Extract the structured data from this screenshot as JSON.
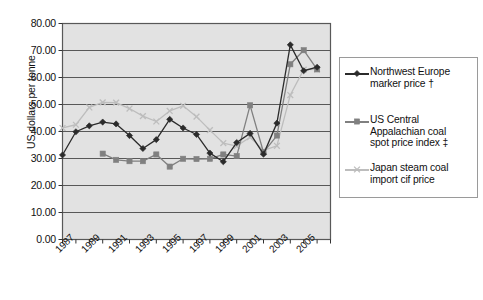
{
  "chart_data": {
    "type": "line",
    "title": "",
    "xlabel": "",
    "ylabel": "US dollars per tonne",
    "ylim": [
      0,
      80
    ],
    "ytick_step": 10,
    "ytick_labels": [
      "0.00",
      "10.00",
      "20.00",
      "30.00",
      "40.00",
      "50.00",
      "60.00",
      "70.00",
      "80.00"
    ],
    "grid": true,
    "grid_axis": "y",
    "plot_background": "#e2e2e2",
    "legend_position": "right",
    "x": [
      1987,
      1988,
      1989,
      1990,
      1991,
      1992,
      1993,
      1994,
      1995,
      1996,
      1997,
      1998,
      1999,
      2000,
      2001,
      2002,
      2003,
      2004,
      2005,
      2006
    ],
    "xtick_labels": [
      "1987",
      "1989",
      "1991",
      "1993",
      "1995",
      "1997",
      "1999",
      "2001",
      "2003",
      "2005"
    ],
    "xtick_years": [
      1987,
      1989,
      1991,
      1993,
      1995,
      1997,
      1999,
      2001,
      2003,
      2005
    ],
    "series": [
      {
        "name": "Northwest Europe marker price †",
        "color": "#2b2b2b",
        "marker": "diamond",
        "values": [
          31.3,
          39.9,
          42.1,
          43.5,
          42.8,
          38.5,
          33.7,
          37.0,
          44.5,
          41.3,
          38.9,
          32.0,
          28.8,
          35.9,
          39.3,
          31.6,
          43.1,
          72.1,
          62.5,
          63.8
        ]
      },
      {
        "name": "US Central Appalachian coal spot price index ‡",
        "color": "#808080",
        "marker": "square",
        "values": [
          null,
          null,
          null,
          31.8,
          29.5,
          29.0,
          29.0,
          31.5,
          27.0,
          29.9,
          29.8,
          29.9,
          31.5,
          30.9,
          49.7,
          32.3,
          38.5,
          64.9,
          70.1,
          63.0
        ]
      },
      {
        "name": "Japan steam coal import cif price",
        "color": "#bdbdbd",
        "marker": "cross",
        "values": [
          41.3,
          42.5,
          48.9,
          50.8,
          50.7,
          48.5,
          45.7,
          43.7,
          47.6,
          49.5,
          45.5,
          40.5,
          35.7,
          34.6,
          37.9,
          33.0,
          34.7,
          53.5,
          62.9,
          63.0
        ]
      }
    ]
  },
  "legend": {
    "entries": [
      {
        "lines": [
          "Northwest Europe",
          "marker price  †"
        ]
      },
      {
        "lines": [
          "US Central",
          "Appalachian coal",
          "spot price index  ‡"
        ]
      },
      {
        "lines": [
          "Japan steam coal",
          "import cif price"
        ]
      }
    ]
  }
}
